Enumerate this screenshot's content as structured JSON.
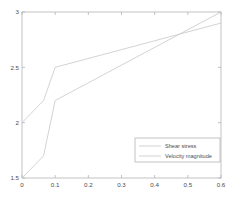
{
  "chart_data": {
    "type": "line",
    "title": "",
    "xlabel": "",
    "ylabel": "",
    "xlim": [
      0,
      0.6
    ],
    "ylim": [
      1.5,
      3
    ],
    "xticks": [
      0,
      0.1,
      0.2,
      0.3,
      0.4,
      0.5,
      0.6
    ],
    "xtick_labels": [
      "0",
      "0.1",
      "0.2",
      "0.3",
      "0.4",
      "0.5",
      "0.6"
    ],
    "yticks": [
      1.5,
      2,
      2.5,
      3
    ],
    "ytick_labels": [
      "1.5",
      "2",
      "2.5",
      "3"
    ],
    "grid": false,
    "legend_position": "lower right",
    "series": [
      {
        "name": "Shear stress",
        "color": "#c8c8c8",
        "x": [
          0,
          0.065,
          0.1,
          0.6
        ],
        "y": [
          2.0,
          2.2,
          2.5,
          2.9
        ]
      },
      {
        "name": "Velocity magnitude",
        "color": "#c8c8c8",
        "x": [
          0,
          0.065,
          0.1,
          0.6
        ],
        "y": [
          1.5,
          1.7,
          2.2,
          3.0
        ]
      }
    ]
  },
  "legend": {
    "entries": [
      {
        "label": "Shear stress"
      },
      {
        "label": "Velocity magnitude"
      }
    ]
  },
  "axes": {
    "frame_color": "#b4b4b4",
    "tick_color": "#4d4d4d"
  }
}
